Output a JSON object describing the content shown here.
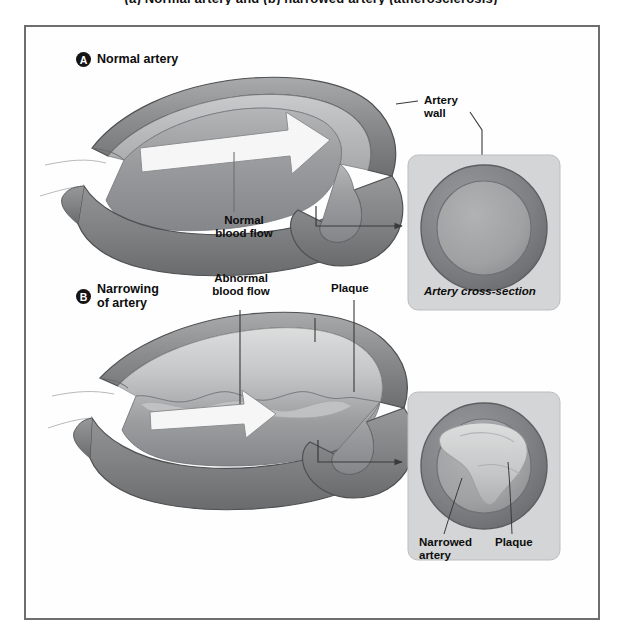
{
  "figure": {
    "top_caption": "(a) Normal artery and (b) narrowed artery (atherosclerosis)",
    "panels": [
      {
        "badge": "A",
        "title": "Normal artery"
      },
      {
        "badge": "B",
        "title": "Narrowing\nof artery"
      }
    ],
    "labels": {
      "normal_blood_flow": "Normal\nblood flow",
      "artery_wall": "Artery\nwall",
      "artery_cross_section": "Artery cross-section",
      "abnormal_blood_flow": "Abnormal\nblood flow",
      "plaque_main": "Plaque",
      "narrowed_artery": "Narrowed\nartery",
      "plaque_inset": "Plaque"
    },
    "colors": {
      "frame_border": "#6e6e6e",
      "page_background": "#ffffff",
      "wall_outer_dark": "#6f7072",
      "wall_outer_mid": "#8e8f91",
      "wall_highlight": "#b9babc",
      "lumen_fill": "#9a9b9d",
      "lumen_shadow": "#7c7d7f",
      "plaque_fill": "#cfd0d1",
      "plaque_shade": "#b0b1b3",
      "arrow_fill": "#f4f4f4",
      "inset_panel": "#d3d4d5",
      "inset_ring": "#86878a",
      "inset_lumen": "#a4a5a7",
      "leader_line": "#3a3a3a",
      "text": "#0d0d0d"
    }
  }
}
